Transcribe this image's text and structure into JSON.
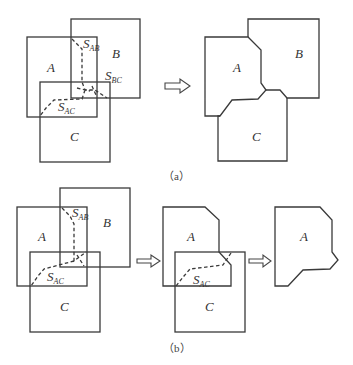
{
  "figure": {
    "panel_a": {
      "caption": "（a）",
      "before": {
        "labels": {
          "A": "A",
          "B": "B",
          "C": "C"
        },
        "overlaps": [
          {
            "main": "S",
            "sub": "AB"
          },
          {
            "main": "S",
            "sub": "BC"
          },
          {
            "main": "S",
            "sub": "AC"
          }
        ]
      },
      "after": {
        "labels": {
          "A": "A",
          "B": "B",
          "C": "C"
        }
      }
    },
    "panel_b": {
      "caption": "（b）",
      "step1": {
        "labels": {
          "A": "A",
          "B": "B",
          "C": "C"
        },
        "overlaps": [
          {
            "main": "S",
            "sub": "AB"
          },
          {
            "main": "S",
            "sub": "AC"
          }
        ]
      },
      "step2": {
        "labels": {
          "A": "A",
          "C": "C"
        },
        "overlaps": [
          {
            "main": "S",
            "sub": "AC"
          }
        ]
      },
      "step3": {
        "labels": {
          "A": "A"
        }
      }
    },
    "colors": {
      "stroke": "#3a3a3a",
      "background": "#ffffff"
    }
  }
}
